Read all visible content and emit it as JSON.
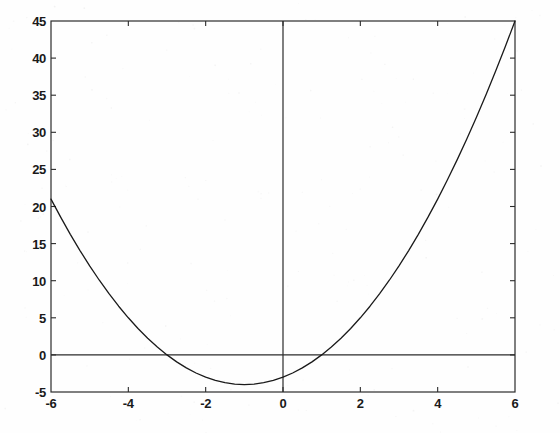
{
  "chart_data": {
    "type": "line",
    "title": "",
    "subtitle": "",
    "xlabel": "",
    "ylabel": "",
    "xlim": [
      -6,
      6
    ],
    "ylim": [
      -5,
      45
    ],
    "grid": false,
    "legend": null,
    "equation": "y = x^2 + 2x - 3",
    "xticks": [
      -6,
      -4,
      -2,
      0,
      2,
      4,
      6
    ],
    "xtick_labels": [
      "-6",
      "-4",
      "-2",
      "0",
      "2",
      "4",
      "6"
    ],
    "yticks": [
      -5,
      0,
      5,
      10,
      15,
      20,
      25,
      30,
      35,
      40,
      45
    ],
    "ytick_labels": [
      "-5",
      "0",
      "5",
      "10",
      "15",
      "20",
      "25",
      "30",
      "35",
      "40",
      "45"
    ],
    "series": [
      {
        "name": "y = x^2 + 2x - 3",
        "color": "#1a1a1a",
        "x": [
          -6,
          -5.75,
          -5.5,
          -5.25,
          -5,
          -4.75,
          -4.5,
          -4.25,
          -4,
          -3.75,
          -3.5,
          -3.25,
          -3,
          -2.75,
          -2.5,
          -2.25,
          -2,
          -1.75,
          -1.5,
          -1.25,
          -1,
          -0.75,
          -0.5,
          -0.25,
          0,
          0.25,
          0.5,
          0.75,
          1,
          1.25,
          1.5,
          1.75,
          2,
          2.25,
          2.5,
          2.75,
          3,
          3.25,
          3.5,
          3.75,
          4,
          4.25,
          4.5,
          4.75,
          5,
          5.25,
          5.5,
          5.75,
          6
        ],
        "values": [
          21,
          18.5625,
          16.25,
          14.0625,
          12,
          10.0625,
          8.25,
          6.5625,
          5,
          3.5625,
          2.25,
          1.0625,
          0,
          -0.9375,
          -1.75,
          -2.4375,
          -3,
          -3.4375,
          -3.75,
          -3.9375,
          -4,
          -3.9375,
          -3.75,
          -3.4375,
          -3,
          -2.4375,
          -1.75,
          -0.9375,
          0,
          1.0625,
          2.25,
          3.5625,
          5,
          6.5625,
          8.25,
          10.0625,
          12,
          14.0625,
          16.25,
          18.5625,
          21,
          23.5625,
          26.25,
          29.0625,
          32,
          35.0625,
          38.25,
          41.5625,
          45
        ]
      }
    ],
    "reference_lines": [
      {
        "name": "y-axis",
        "orientation": "vertical",
        "value": 0
      },
      {
        "name": "x-axis",
        "orientation": "horizontal",
        "value": 0
      }
    ],
    "key_points": {
      "vertex": [
        -1,
        -4
      ],
      "roots": [
        -3,
        1
      ],
      "y_intercept": -3,
      "left_endpoint": [
        -6,
        21
      ],
      "right_endpoint": [
        6,
        45
      ]
    }
  },
  "style": {
    "line_color": "#1a1a1a",
    "axis_color": "#2b2b2b",
    "background": "#fefefe",
    "tick_label_color": "#1a1a1a"
  }
}
